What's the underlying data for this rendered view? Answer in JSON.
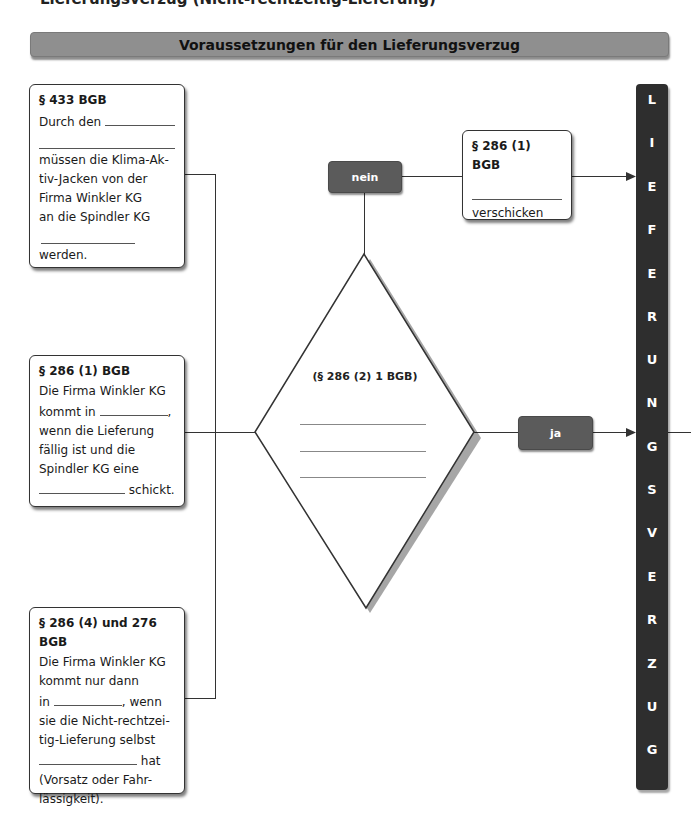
{
  "page_top_cut_text": "Lieferungsverzug (Nicht-rechtzeitig-Lieferung)",
  "header": {
    "title": "Voraussetzungen für den Lieferungsverzug"
  },
  "left_cards": [
    {
      "title": "§ 433 BGB",
      "line1": "Durch den",
      "line2": "müssen die Klima-Ak-",
      "line3": "tiv-Jacken von der",
      "line4": "Firma Winkler KG",
      "line5": "an die Spindler KG",
      "line6": "werden."
    },
    {
      "title": "§ 286 (1) BGB",
      "line1": "Die Firma Winkler KG",
      "line2a": "kommt in",
      "line2b": ",",
      "line3": "wenn die Lieferung",
      "line4": "fällig ist und die",
      "line5": "Spindler KG eine",
      "line6": "schickt."
    },
    {
      "title": "§ 286 (4) und 276 BGB",
      "line1": "Die Firma Winkler KG",
      "line2": "kommt nur dann",
      "line3a": "in",
      "line3b": ", wenn",
      "line4": "sie die Nicht-rechtzei-",
      "line5": "tig-Lieferung selbst",
      "line6": "hat",
      "line7": "(Vorsatz oder Fahr-",
      "line8": "lässigkeit)."
    }
  ],
  "decision": {
    "label": "(§ 286 (2) 1 BGB)"
  },
  "branches": {
    "no_label": "nein",
    "yes_label": "ja"
  },
  "top_right_card": {
    "title": "§ 286 (1) BGB",
    "footer": "verschicken"
  },
  "vertical_bar": {
    "letters": [
      "L",
      "I",
      "E",
      "F",
      "E",
      "R",
      "U",
      "N",
      "G",
      "S",
      "V",
      "E",
      "R",
      "Z",
      "U",
      "G"
    ]
  },
  "colors": {
    "header_bg": "#8f8f8f",
    "pill_bg": "#5b5b5b",
    "bar_bg": "#2e2e2e"
  }
}
